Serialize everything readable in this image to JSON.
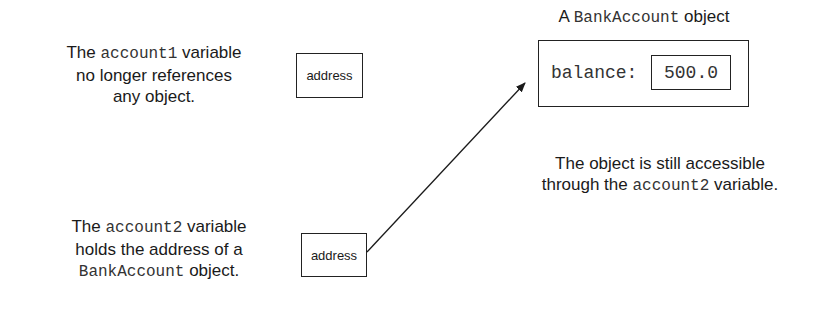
{
  "diagram": {
    "account1_caption": {
      "line1_prefix": "The ",
      "line1_code": "account1",
      "line1_suffix": " variable",
      "line2": "no longer references",
      "line3": "any object."
    },
    "account1_box": {
      "label": "address"
    },
    "account2_caption": {
      "line1_prefix": "The ",
      "line1_code": "account2",
      "line1_suffix": " variable",
      "line2": "holds the address of a",
      "line3_code": "BankAccount",
      "line3_suffix": " object."
    },
    "account2_box": {
      "label": "address"
    },
    "object": {
      "title_prefix": "A ",
      "title_code": "BankAccount",
      "title_suffix": " object",
      "field_name": "balance:",
      "field_value": "500.0"
    },
    "object_caption": {
      "line1": "The object is still accessible",
      "line2_prefix": "through the ",
      "line2_code": "account2",
      "line2_suffix": " variable."
    },
    "arrow": {
      "from": "account2_box",
      "to": "object",
      "color": "#1a1a1a"
    }
  }
}
